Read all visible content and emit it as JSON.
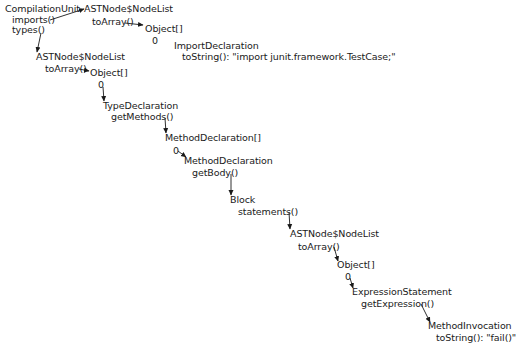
{
  "diagram": {
    "type": "object-navigation-tree",
    "nodes": [
      {
        "id": "compilation_unit",
        "type": "CompilationUnit",
        "members": [
          "imports()",
          "types()"
        ]
      },
      {
        "id": "imports_list",
        "type": "ASTNode$NodeList",
        "members": [
          "toArray()"
        ]
      },
      {
        "id": "imports_array",
        "type": "Object[]",
        "members": [
          "0"
        ]
      },
      {
        "id": "import_decl",
        "type": "ImportDeclaration",
        "members": [
          "toString(): \"import junit.framework.TestCase;\""
        ]
      },
      {
        "id": "types_list",
        "type": "ASTNode$NodeList",
        "members": [
          "toArray()"
        ]
      },
      {
        "id": "types_array",
        "type": "Object[]",
        "members": [
          "0"
        ]
      },
      {
        "id": "type_decl",
        "type": "TypeDeclaration",
        "members": [
          "getMethods()"
        ]
      },
      {
        "id": "methods_array",
        "type": "MethodDeclaration[]",
        "members": [
          "0"
        ]
      },
      {
        "id": "method_decl",
        "type": "MethodDeclaration",
        "members": [
          "getBody()"
        ]
      },
      {
        "id": "block",
        "type": "Block",
        "members": [
          "statements()"
        ]
      },
      {
        "id": "statements_list",
        "type": "ASTNode$NodeList",
        "members": [
          "toArray()"
        ]
      },
      {
        "id": "statements_array",
        "type": "Object[]",
        "members": [
          "0"
        ]
      },
      {
        "id": "expr_stmt",
        "type": "ExpressionStatement",
        "members": [
          "getExpression()"
        ]
      },
      {
        "id": "method_inv",
        "type": "MethodInvocation",
        "members": [
          "toString(): \"fail()\""
        ]
      }
    ],
    "edges": [
      {
        "from": "compilation_unit.imports()",
        "to": "imports_list"
      },
      {
        "from": "imports_list.toArray()",
        "to": "imports_array"
      },
      {
        "from": "compilation_unit.types()",
        "to": "types_list"
      },
      {
        "from": "types_list.toArray()",
        "to": "types_array"
      },
      {
        "from": "types_array.0",
        "to": "type_decl"
      },
      {
        "from": "type_decl.getMethods()",
        "to": "methods_array"
      },
      {
        "from": "methods_array.0",
        "to": "method_decl"
      },
      {
        "from": "method_decl.getBody()",
        "to": "block"
      },
      {
        "from": "block.statements()",
        "to": "statements_list"
      },
      {
        "from": "statements_list.toArray()",
        "to": "statements_array"
      },
      {
        "from": "statements_array.0",
        "to": "expr_stmt"
      },
      {
        "from": "expr_stmt.getExpression()",
        "to": "method_inv"
      }
    ]
  },
  "labels": {
    "cu_title": "CompilationUnit",
    "cu_imports": "imports()",
    "cu_types": "types()",
    "imp_list_title": "ASTNode$NodeList",
    "imp_list_toarray": "toArray()",
    "imp_arr_title": "Object[]",
    "imp_arr_idx": "0",
    "imp_decl_title": "ImportDeclaration",
    "imp_decl_tostring": "toString(): \"import junit.framework.TestCase;\"",
    "typ_list_title": "ASTNode$NodeList",
    "typ_list_toarray": "toArray()",
    "typ_arr_title": "Object[]",
    "typ_arr_idx": "0",
    "type_decl_title": "TypeDeclaration",
    "type_decl_getmethods": "getMethods()",
    "meth_arr_title": "MethodDeclaration[]",
    "meth_arr_idx": "0",
    "meth_decl_title": "MethodDeclaration",
    "meth_decl_getbody": "getBody()",
    "block_title": "Block",
    "block_statements": "statements()",
    "stmt_list_title": "ASTNode$NodeList",
    "stmt_list_toarray": "toArray()",
    "stmt_arr_title": "Object[]",
    "stmt_arr_idx": "0",
    "expr_stmt_title": "ExpressionStatement",
    "expr_stmt_getexpr": "getExpression()",
    "meth_inv_title": "MethodInvocation",
    "meth_inv_tostring": "toString(): \"fail()\""
  },
  "colors": {
    "text": "#1a1a1a",
    "arrow": "#1a1a1a",
    "background": "#ffffff"
  }
}
